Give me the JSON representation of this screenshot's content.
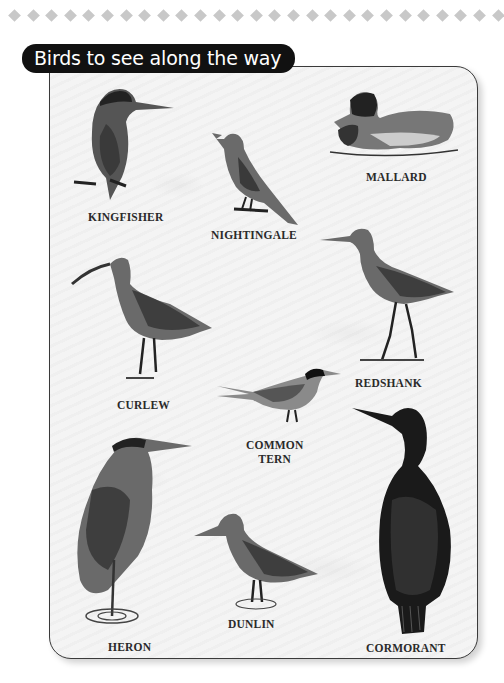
{
  "decoration": {
    "diamond_count": 27,
    "diamond_color": "#c8c8c8"
  },
  "title": "Birds to see along the way",
  "birds": [
    {
      "name": "KINGFISHER"
    },
    {
      "name": "NIGHTINGALE"
    },
    {
      "name": "MALLARD"
    },
    {
      "name": "CURLEW"
    },
    {
      "name": "REDSHANK"
    },
    {
      "name": "COMMON",
      "name_line2": "TERN"
    },
    {
      "name": "HERON"
    },
    {
      "name": "DUNLIN"
    },
    {
      "name": "CORMORANT"
    }
  ],
  "colors": {
    "title_bg": "#111111",
    "title_fg": "#ffffff",
    "card_bg": "#f4f4f4",
    "border": "#3a3a3a",
    "ink": "#2a2a2a"
  }
}
